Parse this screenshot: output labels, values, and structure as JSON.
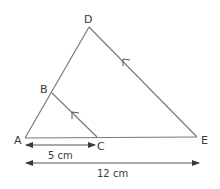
{
  "diagram": {
    "type": "similar-triangles",
    "points": {
      "A": {
        "label": "A",
        "x": 25,
        "y": 138
      },
      "B": {
        "label": "B",
        "x": 52,
        "y": 93
      },
      "C": {
        "label": "C",
        "x": 97,
        "y": 137
      },
      "D": {
        "label": "D",
        "x": 89,
        "y": 27
      },
      "E": {
        "label": "E",
        "x": 197,
        "y": 137
      }
    },
    "segments": [
      "AD",
      "DE",
      "AE",
      "BC"
    ],
    "parallel_marks": [
      "BC",
      "DE"
    ],
    "measurements": {
      "AC": {
        "label": "5 cm"
      },
      "AE": {
        "label": "12 cm"
      }
    },
    "colors": {
      "line": "#7a7a7a",
      "text": "#3a3a3a",
      "background": "#ffffff"
    }
  }
}
